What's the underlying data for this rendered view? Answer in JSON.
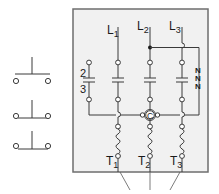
{
  "diagram": {
    "type": "motor-starter-wiring",
    "colors": {
      "panel_fill": "#f1f1f1",
      "panel_border": "#6e6e6e",
      "line": "#3a3a3a",
      "text": "#1a1a1a"
    },
    "line_labels": [
      {
        "main": "L",
        "sub": "1"
      },
      {
        "main": "L",
        "sub": "2"
      },
      {
        "main": "L",
        "sub": "3"
      }
    ],
    "terminal_labels": [
      {
        "main": "T",
        "sub": "1"
      },
      {
        "main": "T",
        "sub": "2"
      },
      {
        "main": "T",
        "sub": "3"
      }
    ],
    "aux_contact_label_top": "2",
    "aux_contact_label_bottom": "3",
    "coil_label": "C",
    "overload_symbols": [
      "N",
      "N",
      "N"
    ],
    "switch_symbols": [
      {
        "name": "normally-open-contact-1"
      },
      {
        "name": "normally-open-contact-2"
      },
      {
        "name": "normally-open-contact-3"
      }
    ]
  }
}
